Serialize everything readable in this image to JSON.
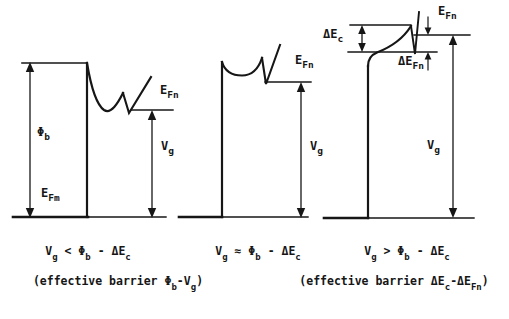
{
  "figure": {
    "bg": "#ffffff",
    "ink": "#161616"
  },
  "panels": [
    {
      "name": "low-bias-panel",
      "labels": {
        "phi_b": [
          {
            "t": "Φ"
          },
          {
            "t": "b",
            "sub": true
          }
        ],
        "e_fm": [
          {
            "t": "E"
          },
          {
            "t": "Fm",
            "sub": true
          }
        ],
        "e_fn": [
          {
            "t": "E"
          },
          {
            "t": "Fn",
            "sub": true
          }
        ],
        "v_g": [
          {
            "t": "V"
          },
          {
            "t": "g",
            "sub": true
          }
        ]
      },
      "caption": [
        {
          "t": "V"
        },
        {
          "t": "g",
          "sub": true
        },
        {
          "t": " < "
        },
        {
          "t": "Φ"
        },
        {
          "t": "b",
          "sub": true
        },
        {
          "t": " - "
        },
        {
          "t": "ΔE"
        },
        {
          "t": "c",
          "sub": true
        }
      ],
      "subcaption": [
        {
          "t": "(effective barrier "
        },
        {
          "t": "Φ"
        },
        {
          "t": "b",
          "sub": true
        },
        {
          "t": "-"
        },
        {
          "t": "V"
        },
        {
          "t": "g",
          "sub": true
        },
        {
          "t": ")"
        }
      ]
    },
    {
      "name": "flat-bias-panel",
      "labels": {
        "e_fn": [
          {
            "t": "E"
          },
          {
            "t": "Fn",
            "sub": true
          }
        ],
        "v_g": [
          {
            "t": "V"
          },
          {
            "t": "g",
            "sub": true
          }
        ]
      },
      "caption": [
        {
          "t": "V"
        },
        {
          "t": "g",
          "sub": true
        },
        {
          "t": " ≈ "
        },
        {
          "t": "Φ"
        },
        {
          "t": "b",
          "sub": true
        },
        {
          "t": " - "
        },
        {
          "t": "ΔE"
        },
        {
          "t": "c",
          "sub": true
        }
      ]
    },
    {
      "name": "high-bias-panel",
      "labels": {
        "delta_e_c": [
          {
            "t": "ΔE"
          },
          {
            "t": "c",
            "sub": true
          }
        ],
        "e_fn": [
          {
            "t": "E"
          },
          {
            "t": "Fn",
            "sub": true
          }
        ],
        "delta_e_fn": [
          {
            "t": "ΔE"
          },
          {
            "t": "Fn",
            "sub": true
          }
        ],
        "v_g": [
          {
            "t": "V"
          },
          {
            "t": "g",
            "sub": true
          }
        ]
      },
      "caption": [
        {
          "t": "V"
        },
        {
          "t": "g",
          "sub": true
        },
        {
          "t": " > "
        },
        {
          "t": "Φ"
        },
        {
          "t": "b",
          "sub": true
        },
        {
          "t": " - "
        },
        {
          "t": "ΔE"
        },
        {
          "t": "c",
          "sub": true
        }
      ],
      "subcaption": [
        {
          "t": "(effective barrier "
        },
        {
          "t": "ΔE"
        },
        {
          "t": "c",
          "sub": true
        },
        {
          "t": "-"
        },
        {
          "t": "ΔE"
        },
        {
          "t": "Fn",
          "sub": true
        },
        {
          "t": ")"
        }
      ]
    }
  ]
}
